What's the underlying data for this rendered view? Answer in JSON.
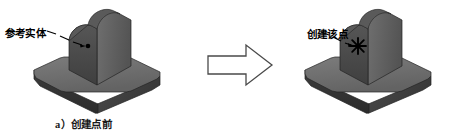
{
  "figure": {
    "type": "cad-illustration",
    "background_color": "#ffffff",
    "width": 471,
    "height": 134
  },
  "panels": {
    "before": {
      "caption": "a）创建点前",
      "leader_label": "参考实体",
      "marker_type": "dot-point",
      "marker_color": "#000000"
    },
    "after": {
      "caption": "b）创建点后",
      "leader_label": "创建该点",
      "marker_type": "star-point",
      "marker_color": "#000000"
    }
  },
  "transition": {
    "arrow_name": "right-block-arrow",
    "stroke_color": "#4a4a4a",
    "fill_color": "#ffffff"
  },
  "model_colors": {
    "base_top": "#6e6e6e",
    "base_front": "#333333",
    "base_side": "#3f3f3f",
    "block_front": "#4a4a4a",
    "block_side": "#5d5d5d",
    "block_top": "#6a6a6a",
    "outline": "#2a2a2a"
  }
}
